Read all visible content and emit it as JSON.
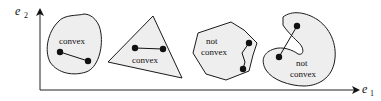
{
  "axes": {
    "y_label": "e",
    "y_subscript": "2",
    "x_label": "e",
    "x_subscript": "1"
  },
  "shapes": [
    {
      "id": "blob",
      "label_lines": [
        "convex"
      ]
    },
    {
      "id": "triangle",
      "label_lines": [
        "convex"
      ]
    },
    {
      "id": "polygon",
      "label_lines": [
        "not",
        "convex"
      ]
    },
    {
      "id": "kidney",
      "label_lines": [
        "not",
        "convex"
      ]
    }
  ],
  "colors": {
    "fill": "#eeeeee",
    "stroke": "#1a1a1a",
    "point": "#111111"
  }
}
